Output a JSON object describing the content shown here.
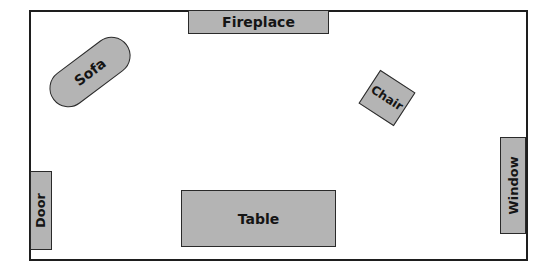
{
  "diagram": {
    "type": "floor-plan",
    "room": {
      "border_color": "#1e1e1e",
      "background": "#ffffff"
    },
    "furniture_color": "#b4b4b4",
    "items": {
      "fireplace": {
        "label": "Fireplace",
        "position": "top wall",
        "rotation_deg": 0
      },
      "sofa": {
        "label": "Sofa",
        "position": "upper left",
        "shape": "rounded pill",
        "rotation_deg": -37
      },
      "chair": {
        "label": "Chair",
        "position": "upper right",
        "shape": "square",
        "rotation_deg": 33
      },
      "door": {
        "label": "Door",
        "position": "left wall, lower",
        "rotation_deg": -90
      },
      "table": {
        "label": "Table",
        "position": "bottom center",
        "rotation_deg": 0
      },
      "window": {
        "label": "Window",
        "position": "right wall, lower",
        "rotation_deg": -90
      }
    }
  }
}
